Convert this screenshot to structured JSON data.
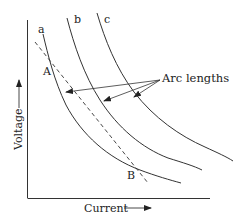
{
  "diagram": {
    "type": "voltage-current arc characteristic curves",
    "axes": {
      "x_label": "Current",
      "y_label": "Voltage"
    },
    "curves": [
      {
        "label": "a"
      },
      {
        "label": "b"
      },
      {
        "label": "c"
      }
    ],
    "points": [
      {
        "label": "A"
      },
      {
        "label": "B"
      }
    ],
    "annotation": {
      "text": "Arc lengths"
    },
    "line_color": "#333333",
    "background": "#ffffff"
  }
}
